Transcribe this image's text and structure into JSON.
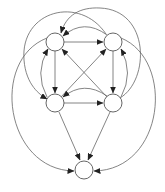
{
  "diagram": {
    "type": "directed-graph",
    "stroke_color": "#555555",
    "node_fill": "#ffffff",
    "nodes": [
      {
        "id": "A",
        "label": "",
        "cx": 55,
        "cy": 42,
        "r": 9
      },
      {
        "id": "B",
        "label": "",
        "cx": 113,
        "cy": 42,
        "r": 9
      },
      {
        "id": "C",
        "label": "",
        "cx": 55,
        "cy": 103,
        "r": 9
      },
      {
        "id": "D",
        "label": "",
        "cx": 113,
        "cy": 103,
        "r": 9
      },
      {
        "id": "E",
        "label": "",
        "cx": 84,
        "cy": 170,
        "r": 9
      }
    ],
    "edges": [
      {
        "from": "A",
        "to": "B",
        "kind": "straight"
      },
      {
        "from": "B",
        "to": "A",
        "kind": "arc"
      },
      {
        "from": "A",
        "to": "C",
        "kind": "straight"
      },
      {
        "from": "C",
        "to": "A",
        "kind": "arc"
      },
      {
        "from": "B",
        "to": "D",
        "kind": "straight"
      },
      {
        "from": "D",
        "to": "B",
        "kind": "arc"
      },
      {
        "from": "C",
        "to": "D",
        "kind": "straight"
      },
      {
        "from": "D",
        "to": "C",
        "kind": "arc"
      },
      {
        "from": "C",
        "to": "B",
        "kind": "straight"
      },
      {
        "from": "D",
        "to": "A",
        "kind": "straight"
      },
      {
        "from": "C",
        "to": "E",
        "kind": "straight"
      },
      {
        "from": "D",
        "to": "E",
        "kind": "straight"
      },
      {
        "from": "A",
        "to": "E",
        "kind": "big-arc"
      },
      {
        "from": "B",
        "to": "E",
        "kind": "big-arc"
      },
      {
        "from": "B",
        "to": "C",
        "kind": "outer-arc"
      },
      {
        "from": "D",
        "to": "A",
        "kind": "outer-arc"
      }
    ]
  }
}
